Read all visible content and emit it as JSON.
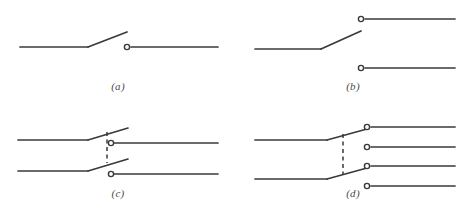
{
  "figure": {
    "background_color": "#ffffff",
    "line_color": "#3a3a3a",
    "dashed_color": "#3a3a3a",
    "terminal_fill": "#ffffff",
    "caption_color": "#4a4a4a",
    "line_width": 1.7,
    "terminal_radius": 2.6
  },
  "panels": [
    {
      "id": "a",
      "caption": "(a)",
      "name": "single-pole-single-throw-switch",
      "poles": 1,
      "throws": 1,
      "terminals": 1,
      "dashed_coupler": false,
      "geometry": {
        "lines": [
          {
            "name": "left-lead-a",
            "points": "20,47 88,47"
          },
          {
            "name": "blade-a",
            "points": "88,47 127,32"
          },
          {
            "name": "right-lead-a",
            "points": "131,47 218,47"
          }
        ],
        "terminals": [
          {
            "name": "terminal-a-1",
            "cx": 127,
            "cy": 47
          }
        ],
        "dashes": []
      }
    },
    {
      "id": "b",
      "caption": "(b)",
      "name": "single-pole-double-throw-switch",
      "poles": 1,
      "throws": 2,
      "terminals": 2,
      "dashed_coupler": false,
      "geometry": {
        "lines": [
          {
            "name": "left-lead-b",
            "points": "20,49 86,49"
          },
          {
            "name": "blade-b",
            "points": "86,49 126,31"
          },
          {
            "name": "upper-lead-b",
            "points": "130,19 220,19"
          },
          {
            "name": "lower-lead-b",
            "points": "130,68 220,68"
          }
        ],
        "terminals": [
          {
            "name": "terminal-b-1",
            "cx": 126,
            "cy": 19
          },
          {
            "name": "terminal-b-2",
            "cx": 126,
            "cy": 68
          }
        ],
        "dashes": []
      }
    },
    {
      "id": "c",
      "caption": "(c)",
      "name": "double-pole-single-throw-switch",
      "poles": 2,
      "throws": 1,
      "terminals": 2,
      "dashed_coupler": true,
      "geometry": {
        "lines": [
          {
            "name": "left-lead-c-upper",
            "points": "18,34 88,34"
          },
          {
            "name": "blade-c-upper",
            "points": "88,34 128,22"
          },
          {
            "name": "left-lead-c-lower",
            "points": "18,65 88,65"
          },
          {
            "name": "blade-c-lower",
            "points": "88,65 128,53"
          },
          {
            "name": "right-lead-c-upper",
            "points": "114,37 218,37"
          },
          {
            "name": "right-lead-c-lower",
            "points": "114,68 218,68"
          }
        ],
        "terminals": [
          {
            "name": "terminal-c-1",
            "cx": 111,
            "cy": 37
          },
          {
            "name": "terminal-c-2",
            "cx": 111,
            "cy": 68
          }
        ],
        "dashes": [
          {
            "name": "coupler-c",
            "x1": 107,
            "y1": 26,
            "x2": 107,
            "y2": 57
          }
        ]
      }
    },
    {
      "id": "d",
      "caption": "(d)",
      "name": "double-pole-double-throw-switch",
      "poles": 2,
      "throws": 2,
      "terminals": 4,
      "dashed_coupler": true,
      "geometry": {
        "lines": [
          {
            "name": "left-lead-d-upper",
            "points": "20,34 92,34"
          },
          {
            "name": "blade-d-upper",
            "points": "92,34 132,23"
          },
          {
            "name": "left-lead-d-lower",
            "points": "20,73 92,73"
          },
          {
            "name": "blade-d-lower",
            "points": "92,73 132,62"
          },
          {
            "name": "right-lead-d-1",
            "points": "136,21 220,21"
          },
          {
            "name": "right-lead-d-2",
            "points": "136,41 220,41"
          },
          {
            "name": "right-lead-d-3",
            "points": "136,60 220,60"
          },
          {
            "name": "right-lead-d-4",
            "points": "136,80 220,80"
          }
        ],
        "terminals": [
          {
            "name": "terminal-d-1",
            "cx": 132,
            "cy": 21
          },
          {
            "name": "terminal-d-2",
            "cx": 132,
            "cy": 41
          },
          {
            "name": "terminal-d-3",
            "cx": 132,
            "cy": 60
          },
          {
            "name": "terminal-d-4",
            "cx": 132,
            "cy": 80
          }
        ],
        "dashes": [
          {
            "name": "coupler-d",
            "x1": 108,
            "y1": 28,
            "x2": 108,
            "y2": 68
          }
        ]
      }
    }
  ]
}
